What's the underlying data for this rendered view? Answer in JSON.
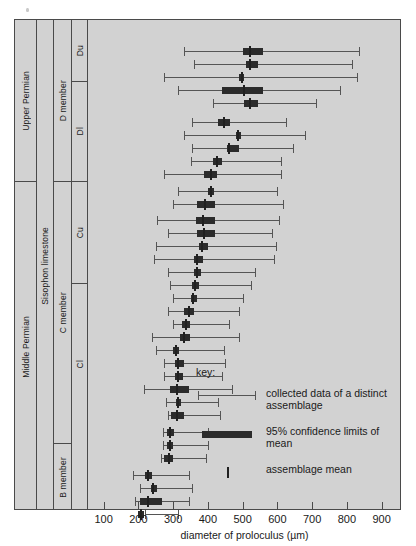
{
  "figure": {
    "speck_label": "a"
  },
  "axis": {
    "title": "diameter of proloculus (µm)",
    "ticks": [
      100,
      200,
      300,
      400,
      500,
      600,
      700,
      800,
      900
    ],
    "tick_labels": [
      "100",
      "200",
      "300",
      "400",
      "500",
      "600",
      "700",
      "800",
      "900"
    ],
    "min": 55,
    "max": 950
  },
  "stratigraphy": {
    "era": [
      {
        "label": "Upper Permian",
        "top": 0,
        "height": 162
      },
      {
        "label": "Middle Permian",
        "top": 162,
        "height": 329
      }
    ],
    "formation": [
      {
        "label": "Sisophon limestone",
        "top": 0,
        "height": 491
      }
    ],
    "members": [
      {
        "label": "D member",
        "top": 0,
        "height": 162
      },
      {
        "label": "C member",
        "top": 162,
        "height": 262
      },
      {
        "label": "B member",
        "top": 424,
        "height": 67
      }
    ],
    "submembers": [
      {
        "label": "Du",
        "top": 0,
        "height": 62
      },
      {
        "label": "Dl",
        "top": 62,
        "height": 100
      },
      {
        "label": "Cu",
        "top": 162,
        "height": 102
      },
      {
        "label": "Cl",
        "top": 264,
        "height": 160
      }
    ]
  },
  "key": {
    "title": "key:",
    "items": [
      {
        "kind": "range",
        "label": "collected data of a distinct assemblage"
      },
      {
        "kind": "ci",
        "label": "95% confidence limits of mean"
      },
      {
        "kind": "mean",
        "label": "assemblage mean"
      }
    ]
  },
  "chart_data": {
    "type": "box",
    "title": "",
    "xlabel": "diameter of proloculus (µm)",
    "ylabel": "",
    "xlim": [
      55,
      950
    ],
    "grid": false,
    "orientation": "horizontal",
    "series_fields": [
      "min",
      "ci_low",
      "mean",
      "ci_high",
      "max"
    ],
    "rows": [
      {
        "unit": "Du",
        "y": 31,
        "min": 330,
        "ci_low": 500,
        "mean": 520,
        "ci_high": 560,
        "max": 835
      },
      {
        "unit": "Du",
        "y": 44,
        "min": 360,
        "ci_low": 510,
        "mean": 520,
        "ci_high": 545,
        "max": 815
      },
      {
        "unit": "Du",
        "y": 57,
        "min": 275,
        "ci_low": 490,
        "mean": 497,
        "ci_high": 505,
        "max": 830
      },
      {
        "unit": "Du",
        "y": 70,
        "min": 315,
        "ci_low": 440,
        "mean": 505,
        "ci_high": 560,
        "max": 780
      },
      {
        "unit": "Du",
        "y": 83,
        "min": 415,
        "ci_low": 505,
        "mean": 520,
        "ci_high": 545,
        "max": 710
      },
      {
        "unit": "Dl",
        "y": 102,
        "min": 355,
        "ci_low": 430,
        "mean": 445,
        "ci_high": 465,
        "max": 625
      },
      {
        "unit": "Dl",
        "y": 115,
        "min": 330,
        "ci_low": 480,
        "mean": 487,
        "ci_high": 495,
        "max": 680
      },
      {
        "unit": "Dl",
        "y": 128,
        "min": 355,
        "ci_low": 455,
        "mean": 462,
        "ci_high": 490,
        "max": 645
      },
      {
        "unit": "Dl",
        "y": 141,
        "min": 350,
        "ci_low": 415,
        "mean": 425,
        "ci_high": 440,
        "max": 610
      },
      {
        "unit": "Dl",
        "y": 154,
        "min": 275,
        "ci_low": 390,
        "mean": 410,
        "ci_high": 425,
        "max": 610
      },
      {
        "unit": "Cu",
        "y": 171,
        "min": 315,
        "ci_low": 400,
        "mean": 408,
        "ci_high": 418,
        "max": 600
      },
      {
        "unit": "Cu",
        "y": 184,
        "min": 300,
        "ci_low": 370,
        "mean": 392,
        "ci_high": 420,
        "max": 615
      },
      {
        "unit": "Cu",
        "y": 200,
        "min": 255,
        "ci_low": 365,
        "mean": 385,
        "ci_high": 420,
        "max": 605
      },
      {
        "unit": "Cu",
        "y": 213,
        "min": 285,
        "ci_low": 370,
        "mean": 390,
        "ci_high": 420,
        "max": 585
      },
      {
        "unit": "Cu",
        "y": 226,
        "min": 250,
        "ci_low": 375,
        "mean": 382,
        "ci_high": 400,
        "max": 595
      },
      {
        "unit": "Cu",
        "y": 239,
        "min": 245,
        "ci_low": 360,
        "mean": 368,
        "ci_high": 385,
        "max": 590
      },
      {
        "unit": "Cu",
        "y": 252,
        "min": 285,
        "ci_low": 360,
        "mean": 368,
        "ci_high": 380,
        "max": 535
      },
      {
        "unit": "Cl",
        "y": 265,
        "min": 290,
        "ci_low": 355,
        "mean": 363,
        "ci_high": 375,
        "max": 525
      },
      {
        "unit": "Cl",
        "y": 278,
        "min": 300,
        "ci_low": 350,
        "mean": 358,
        "ci_high": 368,
        "max": 500
      },
      {
        "unit": "Cl",
        "y": 291,
        "min": 285,
        "ci_low": 330,
        "mean": 345,
        "ci_high": 360,
        "max": 490
      },
      {
        "unit": "Cl",
        "y": 304,
        "min": 300,
        "ci_low": 325,
        "mean": 337,
        "ci_high": 348,
        "max": 460
      },
      {
        "unit": "Cl",
        "y": 317,
        "min": 240,
        "ci_low": 320,
        "mean": 330,
        "ci_high": 348,
        "max": 490
      },
      {
        "unit": "Cl",
        "y": 330,
        "min": 250,
        "ci_low": 300,
        "mean": 308,
        "ci_high": 318,
        "max": 445
      },
      {
        "unit": "Cl",
        "y": 343,
        "min": 275,
        "ci_low": 305,
        "mean": 315,
        "ci_high": 330,
        "max": 450
      },
      {
        "unit": "Cl",
        "y": 356,
        "min": 275,
        "ci_low": 305,
        "mean": 315,
        "ci_high": 328,
        "max": 440
      },
      {
        "unit": "Cl",
        "y": 369,
        "min": 215,
        "ci_low": 290,
        "mean": 310,
        "ci_high": 345,
        "max": 470
      },
      {
        "unit": "Cl",
        "y": 382,
        "min": 280,
        "ci_low": 308,
        "mean": 315,
        "ci_high": 322,
        "max": 430
      },
      {
        "unit": "Cl",
        "y": 395,
        "min": 285,
        "ci_low": 295,
        "mean": 310,
        "ci_high": 330,
        "max": 435
      },
      {
        "unit": "B member",
        "y": 412,
        "min": 270,
        "ci_low": 282,
        "mean": 290,
        "ci_high": 302,
        "max": 400
      },
      {
        "unit": "B member",
        "y": 425,
        "min": 270,
        "ci_low": 282,
        "mean": 290,
        "ci_high": 300,
        "max": 400
      },
      {
        "unit": "B member",
        "y": 438,
        "min": 265,
        "ci_low": 275,
        "mean": 288,
        "ci_high": 300,
        "max": 395
      },
      {
        "unit": "B member",
        "y": 455,
        "min": 185,
        "ci_low": 220,
        "mean": 228,
        "ci_high": 240,
        "max": 345
      },
      {
        "unit": "B member",
        "y": 468,
        "min": 205,
        "ci_low": 235,
        "mean": 242,
        "ci_high": 255,
        "max": 355
      },
      {
        "unit": "B member",
        "y": 481,
        "min": 190,
        "ci_low": 205,
        "mean": 228,
        "ci_high": 268,
        "max": 345
      },
      {
        "unit": "B member",
        "y": 494,
        "min": 220,
        "ci_low": 200,
        "mean": 208,
        "ci_high": 215,
        "max": 315
      }
    ]
  }
}
